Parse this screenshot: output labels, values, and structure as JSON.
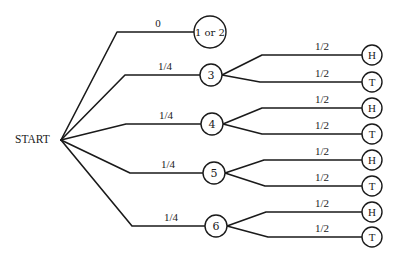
{
  "diagram": {
    "type": "probability-tree",
    "root": {
      "label": "START",
      "x": 61,
      "y": 140,
      "label_x": 15
    },
    "first_level": [
      {
        "label": "1 or 2",
        "prob": "0",
        "elbow_x": 117,
        "y": 32,
        "cx": 210,
        "r": 16,
        "label_x": 158
      },
      {
        "label": "3",
        "prob": "1/4",
        "elbow_x": 125,
        "y": 75,
        "cx": 211,
        "r": 11,
        "label_x": 165
      },
      {
        "label": "4",
        "prob": "1/4",
        "elbow_x": 126,
        "y": 124,
        "cx": 212,
        "r": 11,
        "label_x": 166
      },
      {
        "label": "5",
        "prob": "1/4",
        "elbow_x": 130,
        "y": 173,
        "cx": 214,
        "r": 11,
        "label_x": 168
      },
      {
        "label": "6",
        "prob": "1/4",
        "elbow_x": 132,
        "y": 226,
        "cx": 216,
        "r": 11,
        "label_x": 171
      }
    ],
    "second_level": [
      {
        "parent": "3",
        "outcomes": [
          {
            "label": "H",
            "prob": "1/2",
            "y": 55,
            "elbow_x": 262
          },
          {
            "label": "T",
            "prob": "1/2",
            "y": 82,
            "elbow_x": 260
          }
        ]
      },
      {
        "parent": "4",
        "outcomes": [
          {
            "label": "H",
            "prob": "1/2",
            "y": 108,
            "elbow_x": 262
          },
          {
            "label": "T",
            "prob": "1/2",
            "y": 134,
            "elbow_x": 262
          }
        ]
      },
      {
        "parent": "5",
        "outcomes": [
          {
            "label": "H",
            "prob": "1/2",
            "y": 160,
            "elbow_x": 264
          },
          {
            "label": "T",
            "prob": "1/2",
            "y": 186,
            "elbow_x": 265
          }
        ]
      },
      {
        "parent": "6",
        "outcomes": [
          {
            "label": "H",
            "prob": "1/2",
            "y": 212,
            "elbow_x": 266
          },
          {
            "label": "T",
            "prob": "1/2",
            "y": 237,
            "elbow_x": 268
          }
        ]
      }
    ],
    "outcome_circle": {
      "cx": 372,
      "r": 10
    },
    "colors": {
      "ink": "#1a1a1a",
      "background": "#ffffff"
    }
  }
}
